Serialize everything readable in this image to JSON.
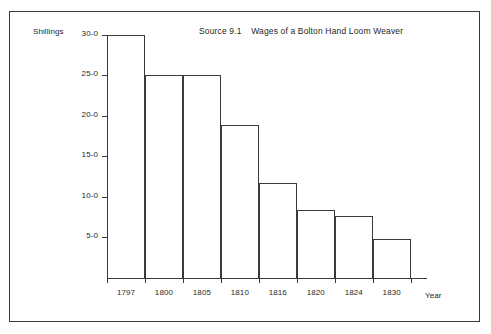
{
  "figure": {
    "title_source": "Source 9.1",
    "title_text": "Wages of a Bolton Hand Loom Weaver",
    "y_axis_label": "Shillings",
    "x_axis_label": "Year",
    "frame_color": "#3a3a3a",
    "bar_outline_color": "#3a3a3a",
    "bar_fill_color": "#ffffff",
    "background_color": "#ffffff"
  },
  "chart_data": {
    "type": "bar",
    "title": "Source 9.1  Wages of a Bolton Hand Loom Weaver",
    "xlabel": "Year",
    "ylabel": "Shillings",
    "categories": [
      "1797",
      "1800",
      "1805",
      "1810",
      "1816",
      "1820",
      "1824",
      "1830"
    ],
    "values": [
      30.0,
      25.0,
      25.0,
      18.8,
      11.7,
      8.4,
      7.7,
      4.8
    ],
    "value_labels": [
      "30-0",
      "25-0",
      "25-0",
      "18-9",
      "11-8",
      "8-5",
      "7-8",
      "4-9"
    ],
    "ylim": [
      0,
      30
    ],
    "ytick_values": [
      5,
      10,
      15,
      20,
      25,
      30
    ],
    "ytick_labels": [
      "5-0",
      "10-0",
      "15-0",
      "20-0",
      "25-0",
      "30-0"
    ],
    "grid": false,
    "legend": false
  }
}
